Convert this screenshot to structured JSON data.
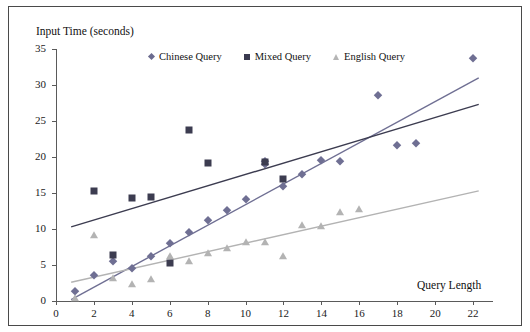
{
  "chart_data": {
    "type": "scatter",
    "title": "",
    "ylabel": "Input Time (seconds)",
    "xlabel": "Query Length",
    "xlim": [
      0,
      23
    ],
    "ylim": [
      0,
      35
    ],
    "xticks": [
      0,
      2,
      4,
      6,
      8,
      10,
      12,
      14,
      16,
      18,
      20,
      22
    ],
    "yticks": [
      0,
      5,
      10,
      15,
      20,
      25,
      30,
      35
    ],
    "grid": false,
    "legend_position": "top-center",
    "legend": [
      "Chinese Query",
      "Mixed Query",
      "English Query"
    ],
    "series": [
      {
        "name": "Chinese Query",
        "marker": "diamond",
        "color": "#6f6f93",
        "points": [
          [
            1,
            1.4
          ],
          [
            2,
            3.6
          ],
          [
            3,
            5.5
          ],
          [
            4,
            4.6
          ],
          [
            5,
            6.2
          ],
          [
            6,
            8.0
          ],
          [
            7,
            9.6
          ],
          [
            8,
            11.2
          ],
          [
            9,
            12.7
          ],
          [
            10,
            14.1
          ],
          [
            11,
            19.4
          ],
          [
            11,
            19.0
          ],
          [
            12,
            16.0
          ],
          [
            13,
            17.7
          ],
          [
            14,
            19.6
          ],
          [
            15,
            19.4
          ],
          [
            17,
            28.6
          ],
          [
            18,
            21.6
          ],
          [
            19,
            21.9
          ],
          [
            22,
            33.8
          ]
        ],
        "trendline": {
          "x0": 0.8,
          "y0": 0.2,
          "x1": 22.3,
          "y1": 31.0
        }
      },
      {
        "name": "Mixed Query",
        "marker": "square",
        "color": "#3c3c50",
        "points": [
          [
            2,
            15.3
          ],
          [
            3,
            6.4
          ],
          [
            4,
            14.3
          ],
          [
            5,
            14.5
          ],
          [
            6,
            5.3
          ],
          [
            7,
            23.7
          ],
          [
            8,
            19.1
          ],
          [
            11,
            19.3
          ],
          [
            12,
            17.0
          ]
        ],
        "trendline": {
          "x0": 0.8,
          "y0": 10.3,
          "x1": 22.3,
          "y1": 27.3
        }
      },
      {
        "name": "English Query",
        "marker": "triangle",
        "color": "#b3b3b3",
        "points": [
          [
            1,
            0.4
          ],
          [
            2,
            9.2
          ],
          [
            3,
            3.2
          ],
          [
            4,
            2.4
          ],
          [
            5,
            3.0
          ],
          [
            6,
            6.3
          ],
          [
            7,
            5.5
          ],
          [
            8,
            6.6
          ],
          [
            9,
            7.4
          ],
          [
            10,
            8.2
          ],
          [
            11,
            8.2
          ],
          [
            12,
            6.2
          ],
          [
            13,
            10.6
          ],
          [
            14,
            10.4
          ],
          [
            15,
            12.4
          ],
          [
            16,
            12.8
          ]
        ],
        "trendline": {
          "x0": 0.8,
          "y0": 2.6,
          "x1": 22.3,
          "y1": 15.3
        }
      }
    ]
  }
}
